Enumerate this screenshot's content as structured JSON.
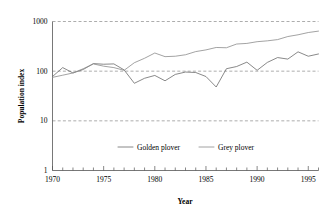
{
  "chart_data": {
    "type": "line",
    "title": "",
    "xlabel": "Year",
    "ylabel": "Population index",
    "yscale": "log",
    "ylim": [
      1,
      1000
    ],
    "xlim": [
      1970,
      1996
    ],
    "grid": true,
    "y_ticks": [
      "1000",
      "100",
      "10",
      "1"
    ],
    "y_tick_values": [
      1000,
      100,
      10,
      1
    ],
    "x_ticks": [
      "1970",
      "1975",
      "1980",
      "1985",
      "1990",
      "1995"
    ],
    "x_tick_values": [
      1970,
      1975,
      1980,
      1985,
      1990,
      1995
    ],
    "x_minor_step": 1,
    "legend_position": "inside-lower-center",
    "x": [
      1970,
      1971,
      1972,
      1973,
      1974,
      1975,
      1976,
      1977,
      1978,
      1979,
      1980,
      1981,
      1982,
      1983,
      1984,
      1985,
      1986,
      1987,
      1988,
      1989,
      1990,
      1991,
      1992,
      1993,
      1994,
      1995,
      1996
    ],
    "series": [
      {
        "name": "Golden plover",
        "color": "#6b6b6b",
        "values": [
          78,
          118,
          92,
          108,
          142,
          138,
          140,
          106,
          57,
          72,
          82,
          64,
          86,
          96,
          94,
          78,
          48,
          112,
          124,
          152,
          104,
          150,
          188,
          175,
          245,
          200,
          222
        ]
      },
      {
        "name": "Grey plover",
        "color": "#8c8c8c",
        "values": [
          75,
          83,
          92,
          112,
          140,
          126,
          118,
          104,
          148,
          182,
          232,
          196,
          200,
          214,
          248,
          268,
          300,
          296,
          352,
          362,
          392,
          408,
          432,
          498,
          540,
          600,
          640
        ]
      }
    ]
  },
  "legend": {
    "items": [
      {
        "label": "Golden plover"
      },
      {
        "label": "Grey plover"
      }
    ]
  }
}
